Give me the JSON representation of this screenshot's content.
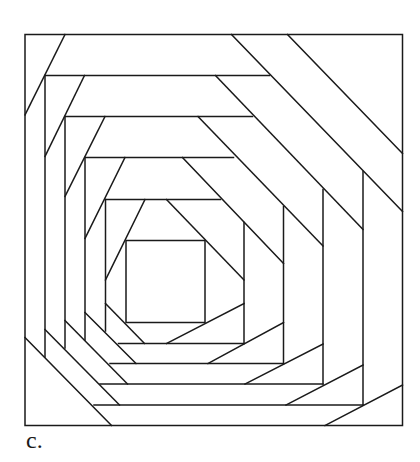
{
  "figure": {
    "caption": "c.",
    "stroke_color": "#1a1a1a",
    "background": "#ffffff",
    "outer_square": {
      "x1": 25,
      "y1": 34.5,
      "x2": 402.5,
      "y2": 425.5
    },
    "inner_square": {
      "x1": 126,
      "y1": 240.5,
      "x2": 205,
      "y2": 322.5
    },
    "ring_edges": [
      {
        "ring": 1,
        "side": "top",
        "x1": 45,
        "y1": 75.5,
        "x2": 269.5,
        "y2": 75.5
      },
      {
        "ring": 1,
        "side": "right",
        "x1": 363,
        "y1": 171.5,
        "x2": 363,
        "y2": 405
      },
      {
        "ring": 1,
        "side": "bottom",
        "x1": 94,
        "y1": 405,
        "x2": 363,
        "y2": 405
      },
      {
        "ring": 1,
        "side": "left",
        "x1": 45,
        "y1": 75.5,
        "x2": 45,
        "y2": 357
      },
      {
        "ring": 2,
        "side": "top",
        "x1": 65,
        "y1": 116.5,
        "x2": 252.5,
        "y2": 116.5
      },
      {
        "ring": 2,
        "side": "right",
        "x1": 323,
        "y1": 189.5,
        "x2": 323,
        "y2": 384
      },
      {
        "ring": 2,
        "side": "bottom",
        "x1": 100,
        "y1": 384,
        "x2": 323,
        "y2": 384
      },
      {
        "ring": 2,
        "side": "left",
        "x1": 65,
        "y1": 116.5,
        "x2": 65,
        "y2": 348
      },
      {
        "ring": 3,
        "side": "top",
        "x1": 85,
        "y1": 157.5,
        "x2": 233.5,
        "y2": 157.5
      },
      {
        "ring": 3,
        "side": "right",
        "x1": 283.5,
        "y1": 206.5,
        "x2": 283.5,
        "y2": 363.5
      },
      {
        "ring": 3,
        "side": "bottom",
        "x1": 110,
        "y1": 363.5,
        "x2": 283.5,
        "y2": 363.5
      },
      {
        "ring": 3,
        "side": "left",
        "x1": 85,
        "y1": 157.5,
        "x2": 85,
        "y2": 340
      },
      {
        "ring": 4,
        "side": "top",
        "x1": 105.5,
        "y1": 199.5,
        "x2": 220.5,
        "y2": 199.5
      },
      {
        "ring": 4,
        "side": "right",
        "x1": 244,
        "y1": 222.5,
        "x2": 244,
        "y2": 343.5
      },
      {
        "ring": 4,
        "side": "bottom",
        "x1": 118.5,
        "y1": 343.5,
        "x2": 244,
        "y2": 343.5
      },
      {
        "ring": 4,
        "side": "left",
        "x1": 105.5,
        "y1": 199.5,
        "x2": 105.5,
        "y2": 331
      }
    ],
    "diagonals": [
      {
        "corner": "top-right",
        "ring": 0,
        "x1": 287.5,
        "y1": 34.5,
        "x2": 402.5,
        "y2": 153.5
      },
      {
        "corner": "top-right",
        "ring": 0,
        "x1": 231.5,
        "y1": 34.5,
        "x2": 402.5,
        "y2": 211.5
      },
      {
        "corner": "top-right",
        "ring": 1,
        "x1": 215.5,
        "y1": 75.5,
        "x2": 363,
        "y2": 229.5
      },
      {
        "corner": "top-right",
        "ring": 2,
        "x1": 198,
        "y1": 116.5,
        "x2": 323,
        "y2": 246
      },
      {
        "corner": "top-right",
        "ring": 3,
        "x1": 182.5,
        "y1": 157.5,
        "x2": 283.5,
        "y2": 263.5
      },
      {
        "corner": "top-right",
        "ring": 4,
        "x1": 166.5,
        "y1": 199.5,
        "x2": 244,
        "y2": 280
      },
      {
        "corner": "top-left",
        "ring": 0,
        "x1": 65,
        "y1": 34.5,
        "x2": 25,
        "y2": 115
      },
      {
        "corner": "top-left",
        "ring": 1,
        "x1": 84.5,
        "y1": 75.5,
        "x2": 45,
        "y2": 156.5
      },
      {
        "corner": "top-left",
        "ring": 2,
        "x1": 105,
        "y1": 116.5,
        "x2": 65,
        "y2": 196.5
      },
      {
        "corner": "top-left",
        "ring": 3,
        "x1": 125,
        "y1": 157.5,
        "x2": 85,
        "y2": 238.5
      },
      {
        "corner": "top-left",
        "ring": 4,
        "x1": 145,
        "y1": 199.5,
        "x2": 105.5,
        "y2": 280
      },
      {
        "corner": "bottom-left",
        "ring": 0,
        "x1": 25,
        "y1": 337.5,
        "x2": 111.5,
        "y2": 425.5
      },
      {
        "corner": "bottom-left",
        "ring": 1,
        "x1": 45,
        "y1": 329.5,
        "x2": 119.5,
        "y2": 405
      },
      {
        "corner": "bottom-left",
        "ring": 2,
        "x1": 65,
        "y1": 320.5,
        "x2": 127.5,
        "y2": 384
      },
      {
        "corner": "bottom-left",
        "ring": 3,
        "x1": 85,
        "y1": 312.5,
        "x2": 136,
        "y2": 363.5
      },
      {
        "corner": "bottom-left",
        "ring": 4,
        "x1": 105.5,
        "y1": 303.5,
        "x2": 144.5,
        "y2": 343.5
      },
      {
        "corner": "bottom-right",
        "ring": 0,
        "x1": 402.5,
        "y1": 385,
        "x2": 325,
        "y2": 425.5
      },
      {
        "corner": "bottom-right",
        "ring": 1,
        "x1": 363,
        "y1": 365,
        "x2": 286,
        "y2": 405
      },
      {
        "corner": "bottom-right",
        "ring": 2,
        "x1": 323,
        "y1": 344,
        "x2": 245,
        "y2": 384
      },
      {
        "corner": "bottom-right",
        "ring": 3,
        "x1": 283.5,
        "y1": 322.5,
        "x2": 208,
        "y2": 363.5
      },
      {
        "corner": "bottom-right",
        "ring": 4,
        "x1": 244,
        "y1": 303.5,
        "x2": 166.5,
        "y2": 343.5
      }
    ]
  }
}
